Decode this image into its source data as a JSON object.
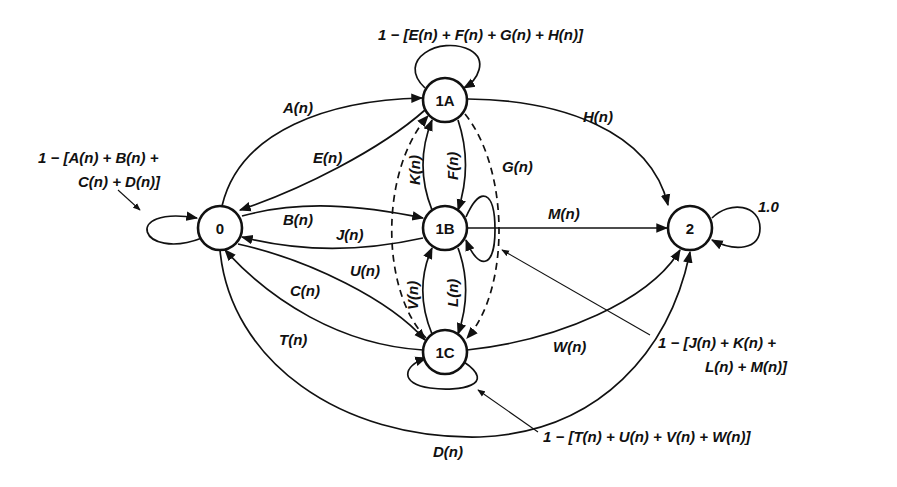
{
  "diagram": {
    "type": "state-transition",
    "nodes": [
      {
        "id": "0",
        "label": "0"
      },
      {
        "id": "1A",
        "label": "1A"
      },
      {
        "id": "1B",
        "label": "1B"
      },
      {
        "id": "1C",
        "label": "1C"
      },
      {
        "id": "2",
        "label": "2"
      }
    ],
    "edges": {
      "A": {
        "from": "0",
        "to": "1A",
        "label": "A(n)"
      },
      "B": {
        "from": "0",
        "to": "1B",
        "label": "B(n)"
      },
      "C": {
        "from": "0",
        "to": "1C",
        "label": "C(n)"
      },
      "D": {
        "from": "0",
        "to": "2",
        "label": "D(n)"
      },
      "E": {
        "from": "1A",
        "to": "0",
        "label": "E(n)"
      },
      "F": {
        "from": "1A",
        "to": "1B",
        "label": "F(n)"
      },
      "G": {
        "from": "1A",
        "to": "1C",
        "label": "G(n)",
        "style": "dashed"
      },
      "H": {
        "from": "1A",
        "to": "2",
        "label": "H(n)"
      },
      "J": {
        "from": "1B",
        "to": "0",
        "label": "J(n)"
      },
      "K": {
        "from": "1B",
        "to": "1A",
        "label": "K(n)"
      },
      "L": {
        "from": "1B",
        "to": "1C",
        "label": "L(n)"
      },
      "M": {
        "from": "1B",
        "to": "2",
        "label": "M(n)"
      },
      "T": {
        "from": "1C",
        "to": "0",
        "label": "T(n)"
      },
      "U": {
        "from": "1C",
        "to": "1A",
        "label": "U(n)",
        "style": "dashed"
      },
      "V": {
        "from": "1C",
        "to": "1B",
        "label": "V(n)"
      },
      "W": {
        "from": "1C",
        "to": "2",
        "label": "W(n)"
      }
    },
    "self_loops": {
      "0": {
        "line1": "1 − [A(n) + B(n) +",
        "line2": "C(n) + D(n)]"
      },
      "1A": {
        "line1": "1 − [E(n) + F(n) + G(n) + H(n)]"
      },
      "1B": {
        "line1": "1 − [J(n) + K(n) +",
        "line2": "L(n) + M(n)]"
      },
      "1C": {
        "line1": "1 − [T(n) + U(n) + V(n) + W(n)]"
      },
      "2": {
        "line1": "1.0"
      }
    }
  }
}
